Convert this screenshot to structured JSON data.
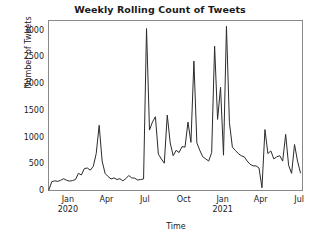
{
  "chart_data": {
    "type": "line",
    "title": "Weekly Rolling Count of Tweets",
    "xlabel": "Time",
    "ylabel": "Number of Tweets",
    "ylim": [
      0,
      3200
    ],
    "xlim": [
      "2019-11-15",
      "2021-07-10"
    ],
    "grid": false,
    "legend": null,
    "line_color": "#2b2b2b",
    "yticks": [
      0,
      500,
      1000,
      1500,
      2000,
      2500,
      3000
    ],
    "ytick_labels": [
      "0",
      "500",
      "1000",
      "1500",
      "2000",
      "2500",
      "3000"
    ],
    "xticks": [
      "2020-01-01",
      "2020-04-01",
      "2020-07-01",
      "2020-10-01",
      "2021-01-01",
      "2021-04-01",
      "2021-07-01"
    ],
    "xtick_labels": [
      {
        "month": "Jan",
        "year": "2020"
      },
      {
        "month": "Apr",
        "year": ""
      },
      {
        "month": "Jul",
        "year": ""
      },
      {
        "month": "Oct",
        "year": ""
      },
      {
        "month": "Jan",
        "year": "2021"
      },
      {
        "month": "Apr",
        "year": ""
      },
      {
        "month": "Jul",
        "year": ""
      }
    ],
    "series": [
      {
        "name": "Weekly rolling tweet count",
        "x": [
          "2019-11-17",
          "2019-11-24",
          "2019-12-01",
          "2019-12-08",
          "2019-12-15",
          "2019-12-22",
          "2019-12-29",
          "2020-01-05",
          "2020-01-12",
          "2020-01-19",
          "2020-01-26",
          "2020-02-02",
          "2020-02-09",
          "2020-02-16",
          "2020-02-23",
          "2020-03-01",
          "2020-03-08",
          "2020-03-15",
          "2020-03-22",
          "2020-03-29",
          "2020-04-05",
          "2020-04-12",
          "2020-04-19",
          "2020-04-26",
          "2020-05-03",
          "2020-05-10",
          "2020-05-17",
          "2020-05-24",
          "2020-05-31",
          "2020-06-07",
          "2020-06-14",
          "2020-06-21",
          "2020-06-28",
          "2020-07-05",
          "2020-07-12",
          "2020-07-19",
          "2020-07-26",
          "2020-08-02",
          "2020-08-09",
          "2020-08-16",
          "2020-08-23",
          "2020-08-30",
          "2020-09-06",
          "2020-09-13",
          "2020-09-20",
          "2020-09-27",
          "2020-10-04",
          "2020-10-11",
          "2020-10-18",
          "2020-10-25",
          "2020-11-01",
          "2020-11-08",
          "2020-11-15",
          "2020-11-22",
          "2020-11-29",
          "2020-12-06",
          "2020-12-13",
          "2020-12-20",
          "2020-12-27",
          "2021-01-03",
          "2021-01-10",
          "2021-01-17",
          "2021-01-24",
          "2021-01-31",
          "2021-02-07",
          "2021-02-14",
          "2021-02-21",
          "2021-02-28",
          "2021-03-07",
          "2021-03-14",
          "2021-03-21",
          "2021-03-28",
          "2021-04-04",
          "2021-04-11",
          "2021-04-18",
          "2021-04-25",
          "2021-05-02",
          "2021-05-09",
          "2021-05-16",
          "2021-05-23",
          "2021-05-30",
          "2021-06-06",
          "2021-06-13",
          "2021-06-20",
          "2021-06-27",
          "2021-07-04"
        ],
        "values": [
          20,
          175,
          190,
          180,
          200,
          230,
          200,
          185,
          195,
          215,
          330,
          300,
          420,
          430,
          390,
          460,
          700,
          1230,
          560,
          330,
          270,
          225,
          245,
          215,
          230,
          190,
          230,
          290,
          245,
          240,
          205,
          215,
          225,
          3040,
          1140,
          1290,
          1390,
          690,
          600,
          520,
          1420,
          900,
          660,
          760,
          720,
          830,
          820,
          1290,
          910,
          2430,
          900,
          760,
          640,
          600,
          560,
          720,
          2710,
          1340,
          1940,
          670,
          3080,
          1280,
          820,
          760,
          700,
          660,
          640,
          560,
          500,
          470,
          470,
          430,
          60,
          1150,
          700,
          750,
          600,
          640,
          660,
          560,
          1060,
          480,
          330,
          870,
          560,
          340
        ]
      }
    ]
  }
}
